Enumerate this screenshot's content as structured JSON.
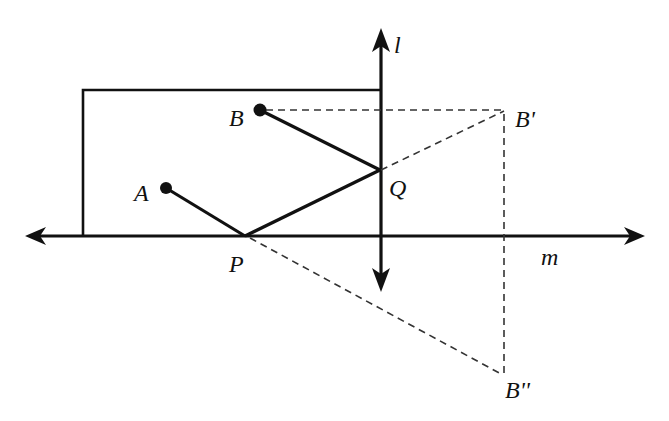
{
  "diagram": {
    "type": "geometry-reflection",
    "colors": {
      "ink": "#111111",
      "dashed": "#333333",
      "background": "#ffffff"
    },
    "labels": {
      "l": "l",
      "m": "m",
      "A": "A",
      "B": "B",
      "B_prime": "B'",
      "B_double_prime": "B''",
      "P": "P",
      "Q": "Q"
    },
    "lines": [
      {
        "name": "l",
        "orientation": "vertical",
        "x": 381,
        "y_start": 28,
        "y_end": 292,
        "arrows": "both"
      },
      {
        "name": "m",
        "orientation": "horizontal",
        "y": 236,
        "x_start": 25,
        "x_end": 645,
        "arrows": "both"
      }
    ],
    "rectangle": {
      "left": 83,
      "top": 90,
      "right": 381,
      "bottom": 236
    },
    "points": {
      "A": [
        166,
        188
      ],
      "B": [
        260,
        110
      ],
      "P": [
        245,
        236
      ],
      "Q": [
        379,
        170
      ],
      "B_prime": [
        504,
        112
      ],
      "B_double_prime": [
        504,
        376
      ]
    },
    "solid_segments": [
      [
        "A",
        "P"
      ],
      [
        "P",
        "Q"
      ],
      [
        "Q",
        "B"
      ]
    ],
    "dashed_segments": [
      [
        "B",
        "B_prime"
      ],
      [
        "Q",
        "B_prime"
      ],
      [
        "B_prime",
        "B_double_prime"
      ],
      [
        "P",
        "B_double_prime"
      ]
    ]
  }
}
